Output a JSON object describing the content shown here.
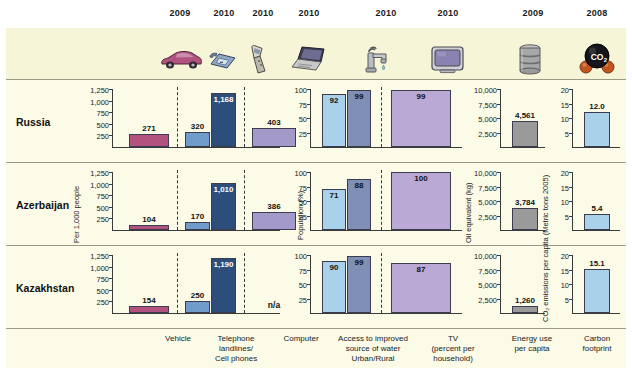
{
  "figure": {
    "countries": [
      "Russia",
      "Azerbaijan",
      "Kazakhstan"
    ],
    "na_label": "n/a"
  },
  "years": [
    {
      "label": "2009",
      "icon": "car-icon"
    },
    {
      "label": "2010",
      "icon": "telephone-landline-icon"
    },
    {
      "label": "2010",
      "icon": "cell-phone-icon"
    },
    {
      "label": "2010",
      "icon": "laptop-computer-icon"
    },
    {
      "label": "2010",
      "icon": "water-tap-icon"
    },
    {
      "label": "2010",
      "icon": "television-icon"
    },
    {
      "label": "2009",
      "icon": "oil-barrel-icon"
    },
    {
      "label": "2008",
      "icon": "co2-molecule-icon"
    }
  ],
  "categories": [
    {
      "name": "vehicle",
      "label": "Vehicle"
    },
    {
      "name": "telephone",
      "label": "Telephone\nlandlines/\nCell phones"
    },
    {
      "name": "computer",
      "label": "Computer"
    },
    {
      "name": "water",
      "label": "Access to improved\nsource of water\nUrban/Rural"
    },
    {
      "name": "tv",
      "label": "TV\n(percent per\nhousehold)"
    },
    {
      "name": "energy",
      "label": "Energy use\nper capita"
    },
    {
      "name": "carbon",
      "label": "Carbon\nfootprint"
    }
  ],
  "axes": {
    "per1000": {
      "title": "Per 1,000 people",
      "ticks": [
        "1,250",
        "1,000",
        "750",
        "500",
        "250"
      ],
      "max": 1250
    },
    "population": {
      "title": "Population (%)",
      "ticks": [
        "100",
        "75",
        "50",
        "25"
      ],
      "max": 100
    },
    "oil": {
      "title": "Oil equivalent (kg)",
      "ticks": [
        "10,000",
        "7,500",
        "5,000",
        "2,500"
      ],
      "max": 10000
    },
    "co2": {
      "title": "CO₂ emissions per capita (Metric tons 2005)",
      "ticks": [
        "20",
        "15",
        "10",
        "5"
      ],
      "max": 20
    }
  },
  "colors": {
    "vehicle": "#b2537f",
    "landline": "#6f9ccb",
    "cellphone": "#2d4d7a",
    "computer": "#a39ac9",
    "water_urban": "#a9d2ea",
    "water_rural": "#7f8fb5",
    "tv": "#b9a9d4",
    "energy": "#9a9a9a",
    "carbon": "#a9d2ea",
    "panel_bg": "#fbfbe8",
    "icon_band_bg": "#f7f5d8",
    "border": "#9a9a86"
  },
  "chart_data": {
    "type": "bar",
    "categories": [
      "Vehicle",
      "Telephone landlines",
      "Cell phones",
      "Computer",
      "Access to improved source of water (Urban)",
      "Access to improved source of water (Rural)",
      "TV (percent per household)",
      "Energy use per capita",
      "Carbon footprint"
    ],
    "panels": [
      {
        "name": "per-1000-people",
        "ylabel": "Per 1,000 people",
        "ylim": [
          0,
          1250
        ],
        "yticks": [
          250,
          500,
          750,
          1000,
          1250
        ],
        "series": [
          {
            "name": "Vehicle",
            "year": "2009",
            "color": "#b2537f",
            "values": [
              271,
              104,
              154
            ]
          },
          {
            "name": "Telephone landlines",
            "year": "2010",
            "color": "#6f9ccb",
            "values": [
              320,
              170,
              250
            ]
          },
          {
            "name": "Cell phones",
            "year": "2010",
            "color": "#2d4d7a",
            "values": [
              1168,
              1010,
              1190
            ]
          },
          {
            "name": "Computer",
            "year": "2010",
            "color": "#a39ac9",
            "values": [
              403,
              386,
              null
            ]
          }
        ]
      },
      {
        "name": "population-percent",
        "ylabel": "Population (%)",
        "ylim": [
          0,
          100
        ],
        "yticks": [
          25,
          50,
          75,
          100
        ],
        "series": [
          {
            "name": "Access to improved source of water Urban",
            "year": "2010",
            "color": "#a9d2ea",
            "values": [
              92,
              71,
              90
            ]
          },
          {
            "name": "Access to improved source of water Rural",
            "year": "2010",
            "color": "#7f8fb5",
            "values": [
              99,
              88,
              99
            ]
          },
          {
            "name": "TV (percent per household)",
            "year": "2010",
            "color": "#b9a9d4",
            "values": [
              99,
              100,
              87
            ]
          }
        ]
      },
      {
        "name": "energy-use-per-capita",
        "ylabel": "Oil equivalent (kg)",
        "ylim": [
          0,
          10000
        ],
        "yticks": [
          2500,
          5000,
          7500,
          10000
        ],
        "series": [
          {
            "name": "Energy use per capita",
            "year": "2009",
            "color": "#9a9a9a",
            "values": [
              4561,
              3784,
              1260
            ]
          }
        ]
      },
      {
        "name": "carbon-footprint",
        "ylabel": "CO₂ emissions per capita (Metric tons 2005)",
        "ylim": [
          0,
          20
        ],
        "yticks": [
          5,
          10,
          15,
          20
        ],
        "series": [
          {
            "name": "Carbon footprint",
            "year": "2008",
            "color": "#a9d2ea",
            "values": [
              12.0,
              5.4,
              15.1
            ]
          }
        ]
      }
    ],
    "rows": [
      "Russia",
      "Azerbaijan",
      "Kazakhstan"
    ],
    "values_by_row": {
      "Russia": {
        "vehicle": 271,
        "landline": 320,
        "cellphone": 1168,
        "computer": 403,
        "water_urban": 92,
        "water_rural": 99,
        "tv": 99,
        "energy": 4561,
        "carbon": 12.0
      },
      "Azerbaijan": {
        "vehicle": 104,
        "landline": 170,
        "cellphone": 1010,
        "computer": 386,
        "water_urban": 71,
        "water_rural": 88,
        "tv": 100,
        "energy": 3784,
        "carbon": 5.4
      },
      "Kazakhstan": {
        "vehicle": 154,
        "landline": 250,
        "cellphone": 1190,
        "computer": null,
        "water_urban": 90,
        "water_rural": 99,
        "tv": 87,
        "energy": 1260,
        "carbon": 15.1
      }
    },
    "labels_by_row": {
      "Russia": {
        "vehicle": "271",
        "landline": "320",
        "cellphone": "1,168",
        "computer": "403",
        "water_urban": "92",
        "water_rural": "99",
        "tv": "99",
        "energy": "4,561",
        "carbon": "12.0"
      },
      "Azerbaijan": {
        "vehicle": "104",
        "landline": "170",
        "cellphone": "1,010",
        "computer": "386",
        "water_urban": "71",
        "water_rural": "88",
        "tv": "100",
        "energy": "3,784",
        "carbon": "5.4"
      },
      "Kazakhstan": {
        "vehicle": "154",
        "landline": "250",
        "cellphone": "1,190",
        "computer": "n/a",
        "water_urban": "90",
        "water_rural": "99",
        "tv": "87",
        "energy": "1,260",
        "carbon": "15.1"
      }
    }
  }
}
